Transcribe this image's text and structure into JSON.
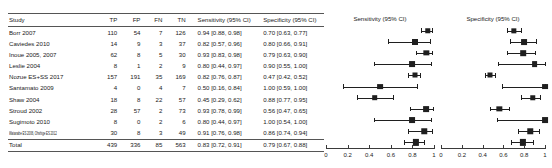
{
  "table": {
    "headers": [
      "Study",
      "TP",
      "FP",
      "FN",
      "TN",
      "Sensitivity (95% CI)",
      "Specificity (95% CI)"
    ],
    "rows": [
      {
        "study": "Borr 2007",
        "tp": "110",
        "fp": "54",
        "fn": "7",
        "tn": "126",
        "sens_text": "0.94 [0.88, 0.98]",
        "spec_text": "0.70 [0.63, 0.77]"
      },
      {
        "study": "Caviedes 2010",
        "tp": "14",
        "fp": "9",
        "fn": "3",
        "tn": "37",
        "sens_text": "0.82 [0.57, 0.96]",
        "spec_text": "0.80 [0.66, 0.91]"
      },
      {
        "study": "Inoue 2005, 2007",
        "tp": "62",
        "fp": "8",
        "fn": "5",
        "tn": "30",
        "sens_text": "0.93 [0.83, 0.98]",
        "spec_text": "0.79 [0.63, 0.90]"
      },
      {
        "study": "Leslie 2004",
        "tp": "8",
        "fp": "1",
        "fn": "2",
        "tn": "9",
        "sens_text": "0.80 [0.44, 0.97]",
        "spec_text": "0.90 [0.55, 1.00]"
      },
      {
        "study": "Nozue ES+SS 2017",
        "tp": "157",
        "fp": "191",
        "fn": "35",
        "tn": "169",
        "sens_text": "0.82 [0.76, 0.87]",
        "spec_text": "0.47 [0.42, 0.52]"
      },
      {
        "study": "Santamato 2009",
        "tp": "4",
        "fp": "0",
        "fn": "4",
        "tn": "7",
        "sens_text": "0.50 [0.16, 0.84]",
        "spec_text": "1.00 [0.59, 1.00]"
      },
      {
        "study": "Shaw 2004",
        "tp": "18",
        "fp": "8",
        "fn": "22",
        "tn": "57",
        "sens_text": "0.45 [0.29, 0.62]",
        "spec_text": "0.88 [0.77, 0.95]"
      },
      {
        "study": "Stroud 2002",
        "tp": "28",
        "fp": "57",
        "fn": "2",
        "tn": "73",
        "sens_text": "0.93 [0.78, 0.99]",
        "spec_text": "0.56 [0.47, 0.65]"
      },
      {
        "study": "Sugimoto 2010",
        "tp": "8",
        "fp": "0",
        "fn": "2",
        "tn": "6",
        "sens_text": "0.80 [0.44, 0.97]",
        "spec_text": "1.00 [0.54, 1.00]"
      },
      {
        "study": "Watanabe ES 2006, Ohshige ES 2012",
        "squeeze": true,
        "tp": "30",
        "fp": "8",
        "fn": "3",
        "tn": "49",
        "sens_text": "0.91 [0.76, 0.98]",
        "spec_text": "0.86 [0.74, 0.94]"
      },
      {
        "study": "Total",
        "total": true,
        "tp": "439",
        "fp": "336",
        "fn": "85",
        "tn": "563",
        "sens_text": "0.83 [0.72, 0.91]",
        "spec_text": "0.79 [0.67, 0.88]"
      }
    ]
  },
  "chart_data": {
    "type": "forest",
    "panels": [
      {
        "id": "sensitivity",
        "title": "Sensitivity (95% CI)",
        "xlim": [
          0,
          1
        ],
        "ticks": [
          0,
          0.2,
          0.4,
          0.6,
          0.8,
          1
        ],
        "tick_labels": [
          "0",
          "0.2",
          "0.4",
          "0.6",
          "0.8",
          "1"
        ],
        "points": [
          {
            "study": "Borr 2007",
            "est": 0.94,
            "low": 0.88,
            "high": 0.98,
            "weight": 0.62
          },
          {
            "study": "Caviedes 2010",
            "est": 0.82,
            "low": 0.57,
            "high": 0.96,
            "weight": 0.75
          },
          {
            "study": "Inoue 2005, 2007",
            "est": 0.93,
            "low": 0.83,
            "high": 0.98,
            "weight": 0.58
          },
          {
            "study": "Leslie 2004",
            "est": 0.8,
            "low": 0.44,
            "high": 0.97,
            "weight": 0.72
          },
          {
            "study": "Nozue ES+SS 2017",
            "est": 0.82,
            "low": 0.76,
            "high": 0.87,
            "weight": 0.5
          },
          {
            "study": "Santamato 2009",
            "est": 0.5,
            "low": 0.16,
            "high": 0.84,
            "weight": 0.7
          },
          {
            "study": "Shaw 2004",
            "est": 0.45,
            "low": 0.29,
            "high": 0.62,
            "weight": 0.66
          },
          {
            "study": "Stroud 2002",
            "est": 0.93,
            "low": 0.78,
            "high": 0.99,
            "weight": 0.7
          },
          {
            "study": "Sugimoto 2010",
            "est": 0.8,
            "low": 0.44,
            "high": 0.97,
            "weight": 0.72
          },
          {
            "study": "Watanabe ES 2006, Ohshige ES 2012",
            "est": 0.91,
            "low": 0.76,
            "high": 0.98,
            "weight": 0.62
          },
          {
            "study": "Total",
            "est": 0.83,
            "low": 0.72,
            "high": 0.91,
            "weight": 0.8
          }
        ]
      },
      {
        "id": "specificity",
        "title": "Specificity (95% CI)",
        "xlim": [
          0,
          1
        ],
        "ticks": [
          0,
          0.2,
          0.4,
          0.6,
          0.8,
          1
        ],
        "tick_labels": [
          "0",
          "0.2",
          "0.4",
          "0.6",
          "0.8",
          "1"
        ],
        "points": [
          {
            "study": "Borr 2007",
            "est": 0.7,
            "low": 0.63,
            "high": 0.77,
            "weight": 0.58
          },
          {
            "study": "Caviedes 2010",
            "est": 0.8,
            "low": 0.66,
            "high": 0.91,
            "weight": 0.72
          },
          {
            "study": "Inoue 2005, 2007",
            "est": 0.79,
            "low": 0.63,
            "high": 0.9,
            "weight": 0.66
          },
          {
            "study": "Leslie 2004",
            "est": 0.9,
            "low": 0.55,
            "high": 1.0,
            "weight": 0.7
          },
          {
            "study": "Nozue ES+SS 2017",
            "est": 0.47,
            "low": 0.42,
            "high": 0.52,
            "weight": 0.5
          },
          {
            "study": "Santamato 2009",
            "est": 1.0,
            "low": 0.59,
            "high": 1.0,
            "weight": 0.72
          },
          {
            "study": "Shaw 2004",
            "est": 0.88,
            "low": 0.77,
            "high": 0.95,
            "weight": 0.62
          },
          {
            "study": "Stroud 2002",
            "est": 0.56,
            "low": 0.47,
            "high": 0.65,
            "weight": 0.58
          },
          {
            "study": "Sugimoto 2010",
            "est": 1.0,
            "low": 0.54,
            "high": 1.0,
            "weight": 0.72
          },
          {
            "study": "Watanabe ES 2006, Ohshige ES 2012",
            "est": 0.86,
            "low": 0.74,
            "high": 0.94,
            "weight": 0.62
          },
          {
            "study": "Total",
            "est": 0.79,
            "low": 0.67,
            "high": 0.88,
            "weight": 0.8
          }
        ]
      }
    ]
  }
}
